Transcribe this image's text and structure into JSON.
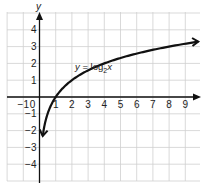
{
  "chart_data": {
    "type": "line",
    "title": "",
    "function_label": "y = log2x",
    "function_label_parts": {
      "lhs": "y",
      "eq": " = log",
      "sub": "2",
      "arg": "x"
    },
    "xlabel": "",
    "ylabel": "y",
    "xlim": [
      -1,
      9
    ],
    "ylim": [
      -4,
      4
    ],
    "grid": true,
    "legend": "none",
    "x_ticks": [
      "-1",
      "0",
      "1",
      "2",
      "3",
      "4",
      "5",
      "6",
      "7",
      "8",
      "9"
    ],
    "y_ticks": [
      "4",
      "3",
      "2",
      "1",
      "-1",
      "-2",
      "-3",
      "-4"
    ],
    "series": [
      {
        "name": "y = log2 x",
        "x": [
          0.2,
          0.25,
          0.5,
          1,
          2,
          4,
          8,
          9.8
        ],
        "y": [
          -2.32,
          -2,
          -1,
          0,
          1,
          2,
          3,
          3.29
        ],
        "arrows": "both ends",
        "color": "#111111"
      }
    ],
    "colors": {
      "grid": "#c8c8c8",
      "axis": "#111111",
      "curve": "#111111"
    }
  }
}
